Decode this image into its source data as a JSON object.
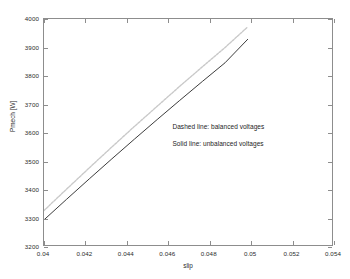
{
  "figure": {
    "background_color": "#ffffff",
    "axes_border_color": "#8d8d8d"
  },
  "chart_data": {
    "type": "line",
    "title": "",
    "xlabel": "slip",
    "ylabel": "Pmech [W]",
    "xlim": [
      0.04,
      0.054
    ],
    "ylim": [
      3200,
      4000
    ],
    "xticks": [
      0.04,
      0.042,
      0.044,
      0.046,
      0.048,
      0.05,
      0.052,
      0.054
    ],
    "xticklabels": [
      "0.04",
      "0.042",
      "0.044",
      "0.046",
      "0.048",
      "0.05",
      "0.052",
      "0.054"
    ],
    "yticks": [
      3200,
      3300,
      3400,
      3500,
      3600,
      3700,
      3800,
      3900,
      4000
    ],
    "yticklabels": [
      "3200",
      "3300",
      "3400",
      "3500",
      "3600",
      "3700",
      "3800",
      "3900",
      "4000"
    ],
    "grid": false,
    "legend_position": "none",
    "series": [
      {
        "name": "balanced voltages",
        "style": "dashed",
        "color": "#c9c9c9",
        "linewidth": 1.4,
        "x": [
          0.04,
          0.0411,
          0.0422,
          0.0433,
          0.0444,
          0.0455,
          0.0466,
          0.0477,
          0.0488,
          0.0499
        ],
        "y": [
          3322,
          3398,
          3473,
          3547,
          3620,
          3691,
          3762,
          3831,
          3899,
          3972
        ]
      },
      {
        "name": "unbalanced voltages",
        "style": "solid",
        "color": "#3a3a3a",
        "linewidth": 1.0,
        "x": [
          0.04,
          0.0411,
          0.0422,
          0.0433,
          0.0444,
          0.0455,
          0.0466,
          0.0477,
          0.0488,
          0.0499
        ],
        "y": [
          3289,
          3362,
          3434,
          3505,
          3575,
          3644,
          3712,
          3779,
          3845,
          3928
        ]
      }
    ],
    "annotations": [
      {
        "text": "Dashed line: balanced voltages",
        "x": 0.0462,
        "y": 3620
      },
      {
        "text": "Solid line: unbalanced voltages",
        "x": 0.0462,
        "y": 3562
      }
    ]
  }
}
